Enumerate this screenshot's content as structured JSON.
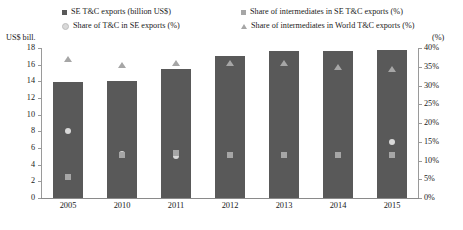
{
  "legend": {
    "items": [
      {
        "label": "SE T&C exports (billion US$)",
        "marker": "square",
        "color": "#595959",
        "slot": "lg-a",
        "name": "legend-se-tc-exports"
      },
      {
        "label": "Share of T&C in SE exports (%)",
        "marker": "diamond",
        "color": "#d9d9d9",
        "slot": "lg-b",
        "name": "legend-share-tc-in-se-exports"
      },
      {
        "label": "Share of intermediates in SE T&C exports (%)",
        "marker": "square",
        "color": "#a6a6a6",
        "slot": "lg-c",
        "name": "legend-share-intermediates-se"
      },
      {
        "label": "Share of intermediates in World T&C exports (%)",
        "marker": "triangle",
        "color": "#a6a6a6",
        "slot": "lg-d",
        "name": "legend-share-intermediates-world"
      }
    ]
  },
  "axes": {
    "y_left_title": "US$ bill.",
    "y_right_title": "(%)",
    "y_left_ticks": [
      "18",
      "16",
      "14",
      "12",
      "10",
      "8",
      "6",
      "4",
      "2",
      "0"
    ],
    "y_right_ticks": [
      "40%",
      "35%",
      "30%",
      "25%",
      "20%",
      "15%",
      "10%",
      "5%",
      "0%"
    ]
  },
  "chart_data": {
    "type": "bar",
    "title": "",
    "xlabel": "",
    "ylabel": "US$ bill.",
    "y2label": "(%)",
    "ylim": [
      0,
      18
    ],
    "y2lim": [
      0,
      40
    ],
    "grid": false,
    "legend_position": "top",
    "categories": [
      "2005",
      "2010",
      "2011",
      "2012",
      "2013",
      "2014",
      "2015"
    ],
    "series": [
      {
        "name": "SE T&C exports (billion US$)",
        "type": "bar",
        "axis": "left",
        "unit": "billion US$",
        "color": "#595959",
        "marker": "square",
        "values": [
          13.9,
          14.1,
          15.5,
          17.0,
          17.7,
          17.6,
          17.8
        ]
      },
      {
        "name": "Share of T&C in SE exports (%)",
        "type": "scatter",
        "axis": "right",
        "unit": "%",
        "color": "#d9d9d9",
        "marker": "diamond",
        "values": [
          18.0,
          11.8,
          11.2,
          11.5,
          11.5,
          11.5,
          15.0
        ]
      },
      {
        "name": "Share of intermediates in SE T&C exports (%)",
        "type": "scatter",
        "axis": "right",
        "unit": "%",
        "color": "#a6a6a6",
        "marker": "square",
        "values": [
          5.5,
          11.5,
          12.0,
          11.5,
          11.5,
          11.5,
          11.5
        ]
      },
      {
        "name": "Share of intermediates in World T&C exports (%)",
        "type": "scatter",
        "axis": "right",
        "unit": "%",
        "color": "#a6a6a6",
        "marker": "triangle",
        "values": [
          37.0,
          35.5,
          36.0,
          36.0,
          36.0,
          35.0,
          34.5
        ]
      }
    ]
  }
}
